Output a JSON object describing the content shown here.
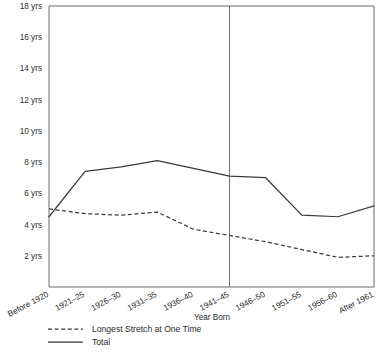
{
  "chart_data": {
    "type": "line",
    "title": "",
    "xlabel": "Year Born",
    "ylabel": "",
    "ylim": [
      0,
      18
    ],
    "yticks": [
      2,
      4,
      6,
      8,
      10,
      12,
      14,
      16,
      18
    ],
    "ytick_labels": [
      "2 yrs",
      "4 yrs",
      "6 yrs",
      "8 yrs",
      "10 yrs",
      "12 yrs",
      "14 yrs",
      "16 yrs",
      "18 yrs"
    ],
    "grid": false,
    "legend_position": "bottom-left",
    "categories": [
      "Before 1920",
      "1921–25",
      "1926–30",
      "1931–35",
      "1936–40",
      "1941–45",
      "1946–50",
      "1951–55",
      "1956–60",
      "After 1961"
    ],
    "series": [
      {
        "name": "Total",
        "style": "solid",
        "color": "#3a3a3a",
        "values": [
          4.5,
          7.4,
          7.7,
          8.1,
          7.6,
          7.1,
          7.0,
          4.6,
          4.5,
          5.2
        ]
      },
      {
        "name": "Longest Stretch at One Time",
        "style": "dashed",
        "color": "#3a3a3a",
        "values": [
          5.0,
          4.7,
          4.6,
          4.8,
          3.7,
          3.3,
          2.9,
          2.4,
          1.9,
          2.0
        ]
      }
    ],
    "annotations": [
      {
        "type": "vertical-reference-line",
        "at_category": "1941–45",
        "color": "#6b6b6b"
      }
    ]
  },
  "legend": {
    "items": [
      {
        "label": "Longest Stretch at One Time",
        "style": "dashed"
      },
      {
        "label": "Total",
        "style": "solid"
      }
    ]
  },
  "axes": {
    "x_title": "Year Born"
  }
}
